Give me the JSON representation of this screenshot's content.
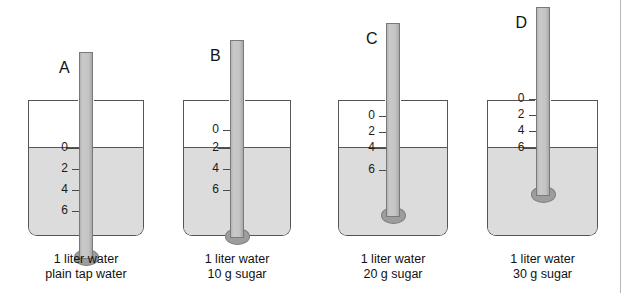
{
  "figure": {
    "type": "diagram",
    "liquid_color": "#dcdcdc",
    "tube_color": "#c4c4c4",
    "bulb_color": "#9d9d9d",
    "outline_color": "#555555",
    "waterline_y": 148,
    "beaker_top_y": 100,
    "beaker_bottom_y": 236
  },
  "setups": [
    {
      "letter": "A",
      "caption_line1": "1 liter water",
      "caption_line2": "plain tap water",
      "reading": 0,
      "tube_top_y": 52,
      "beaker_x": 28,
      "beaker_width": 116,
      "ticks": [
        {
          "label": "0",
          "y": 148,
          "is_reading": true
        },
        {
          "label": "2",
          "y": 169,
          "is_reading": false
        },
        {
          "label": "4",
          "y": 190,
          "is_reading": false
        },
        {
          "label": "6",
          "y": 211,
          "is_reading": false
        }
      ]
    },
    {
      "letter": "B",
      "caption_line1": "1 liter water",
      "caption_line2": "10 g sugar",
      "reading": 2,
      "tube_top_y": 40,
      "beaker_x": 183,
      "beaker_width": 108,
      "ticks": [
        {
          "label": "0",
          "y": 130,
          "is_reading": false
        },
        {
          "label": "2",
          "y": 148,
          "is_reading": true
        },
        {
          "label": "4",
          "y": 169,
          "is_reading": false
        },
        {
          "label": "6",
          "y": 190,
          "is_reading": false
        }
      ]
    },
    {
      "letter": "C",
      "caption_line1": "1 liter water",
      "caption_line2": "20 g sugar",
      "reading": 4,
      "tube_top_y": 23,
      "beaker_x": 338,
      "beaker_width": 110,
      "ticks": [
        {
          "label": "0",
          "y": 116,
          "is_reading": false
        },
        {
          "label": "2",
          "y": 132,
          "is_reading": false
        },
        {
          "label": "4",
          "y": 148,
          "is_reading": true
        },
        {
          "label": "6",
          "y": 170,
          "is_reading": false
        }
      ]
    },
    {
      "letter": "D",
      "caption_line1": "1 liter water",
      "caption_line2": "30 g sugar",
      "reading": 6,
      "tube_top_y": 7,
      "beaker_x": 487,
      "beaker_width": 111,
      "ticks": [
        {
          "label": "0",
          "y": 99,
          "is_reading": false
        },
        {
          "label": "2",
          "y": 115,
          "is_reading": false
        },
        {
          "label": "4",
          "y": 131,
          "is_reading": false
        },
        {
          "label": "6",
          "y": 148,
          "is_reading": true
        }
      ]
    }
  ],
  "chart_data": {
    "type": "table",
    "columns": [
      "Setup",
      "Solution",
      "Hydrometer reading"
    ],
    "rows": [
      [
        "A",
        "1 liter water, plain tap water",
        0
      ],
      [
        "B",
        "1 liter water, 10 g sugar",
        2
      ],
      [
        "C",
        "1 liter water, 20 g sugar",
        4
      ],
      [
        "D",
        "1 liter water, 30 g sugar",
        6
      ]
    ]
  }
}
